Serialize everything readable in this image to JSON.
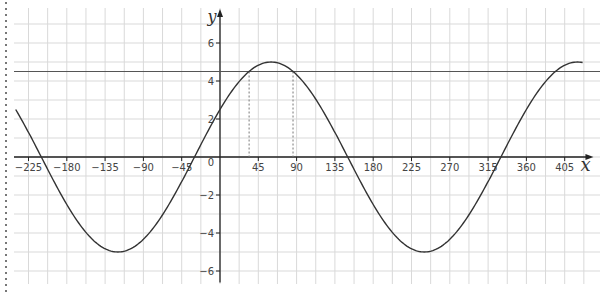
{
  "chart_data": {
    "type": "line",
    "title": "",
    "xlabel": "x",
    "ylabel": "y",
    "function": "y = 5 sin(x + 30°)",
    "xlim": [
      -240,
      420
    ],
    "ylim": [
      -6.5,
      6.5
    ],
    "grid": true,
    "x_ticks": [
      -225,
      -180,
      -135,
      -90,
      -45,
      0,
      45,
      90,
      135,
      180,
      225,
      270,
      315,
      360,
      405
    ],
    "x_tick_labels": [
      "−225",
      "−180",
      "−135",
      "−90",
      "−45",
      "0",
      "45",
      "90",
      "135",
      "180",
      "225",
      "270",
      "315",
      "360",
      "405"
    ],
    "y_ticks": [
      -6,
      -4,
      -2,
      2,
      4,
      6
    ],
    "y_tick_labels": [
      "−6",
      "−4",
      "−2",
      "2",
      "4",
      "6"
    ],
    "series": [
      {
        "name": "curve",
        "x": [
          -240,
          -210,
          -180,
          -150,
          -120,
          -90,
          -60,
          -30,
          0,
          30,
          60,
          90,
          120,
          150,
          180,
          210,
          240,
          270,
          300,
          330,
          360,
          390,
          420
        ],
        "values": [
          2.5,
          0,
          -2.5,
          -4.33,
          -5,
          -4.33,
          -2.5,
          0,
          2.5,
          4.33,
          5,
          4.33,
          2.5,
          0,
          -2.5,
          -4.33,
          -5,
          -4.33,
          -2.5,
          0,
          2.5,
          4.33,
          5
        ]
      }
    ],
    "annotations": [
      {
        "type": "hline",
        "y": 4.5
      },
      {
        "type": "vline-dashed",
        "x": 34.2,
        "y_top": 4.5
      },
      {
        "type": "vline-dashed",
        "x": 85.8,
        "y_top": 4.5
      }
    ]
  },
  "axes": {
    "origin_label": "0",
    "x_label": "x",
    "y_label": "y"
  },
  "colors": {
    "grid": "#d9d9d9",
    "axis": "#222222",
    "curve": "#333333",
    "hline": "#555555"
  }
}
